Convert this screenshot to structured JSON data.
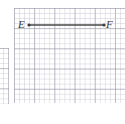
{
  "figure": {
    "kind": "geometry-line-segment-on-grid",
    "caption_points": [
      "E",
      "F"
    ],
    "segment": {
      "name": "segment-EF",
      "label": "EF",
      "endpoint_start_label": "E",
      "endpoint_end_label": "F",
      "color": "#4a4a4a",
      "stroke_width_px": 1.6,
      "x1_px": 29,
      "y1_px": 25,
      "x2_px": 104,
      "y2_px": 25,
      "length_grid_cells": 15,
      "orientation": "horizontal"
    },
    "endpoint_markers": {
      "name": "endpoint-dot",
      "color": "#3d3d3d",
      "radius_px": 1.6
    }
  },
  "grid": {
    "minor_cell_px": 5.05,
    "major_cell_px": 20.2,
    "minor_color": "#babac8",
    "major_color": "#9696a5",
    "background": "#ffffff"
  },
  "panels": [
    {
      "name": "main-grid-panel",
      "x": 14,
      "y": 8,
      "width": 111,
      "height": 95,
      "clipped": false
    },
    {
      "name": "left-partial-panel",
      "x": -12,
      "y": 48,
      "width": 21,
      "height": 56,
      "clipped": true
    }
  ],
  "labels": {
    "E": "E",
    "F": "F"
  }
}
